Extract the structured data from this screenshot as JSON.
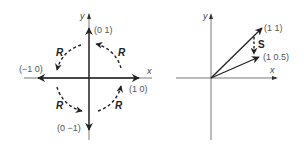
{
  "figure": {
    "left_panel": {
      "axis_x_label": "x",
      "axis_y_label": "y",
      "vectors": [
        {
          "label": "(0  1)",
          "x": 0,
          "y": 1
        },
        {
          "label": "(−1  0)",
          "x": -1,
          "y": 0
        },
        {
          "label": "(0  −1)",
          "x": 0,
          "y": -1
        },
        {
          "label": "(1  0)",
          "x": 1,
          "y": 0
        }
      ],
      "rotation_labels": [
        "R",
        "R",
        "R",
        "R"
      ]
    },
    "right_panel": {
      "axis_x_label": "x",
      "axis_y_label": "y",
      "vectors": [
        {
          "label": "(1  1)",
          "x": 1,
          "y": 1
        },
        {
          "label": "(1  0.5)",
          "x": 1,
          "y": 0.5
        }
      ],
      "transform_label": "S"
    },
    "colors": {
      "line": "#222222",
      "label": "#555555"
    }
  }
}
